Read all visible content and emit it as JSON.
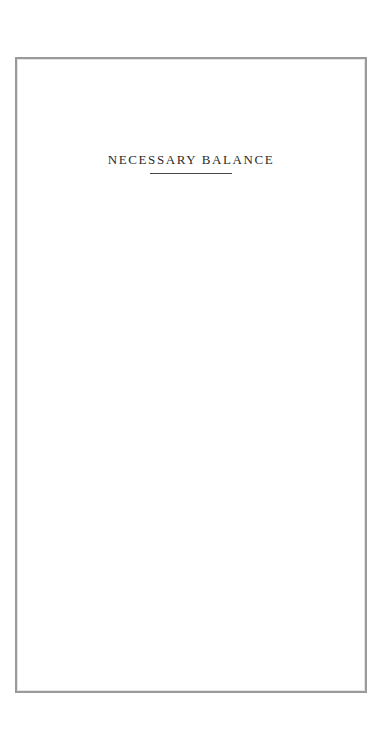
{
  "page": {
    "title": "NECESSARY BALANCE"
  },
  "colors": {
    "frame_border": "#9a9a9a",
    "title_text": "#2b2b2b",
    "title_rule": "#4a4a4a",
    "background": "#ffffff"
  }
}
